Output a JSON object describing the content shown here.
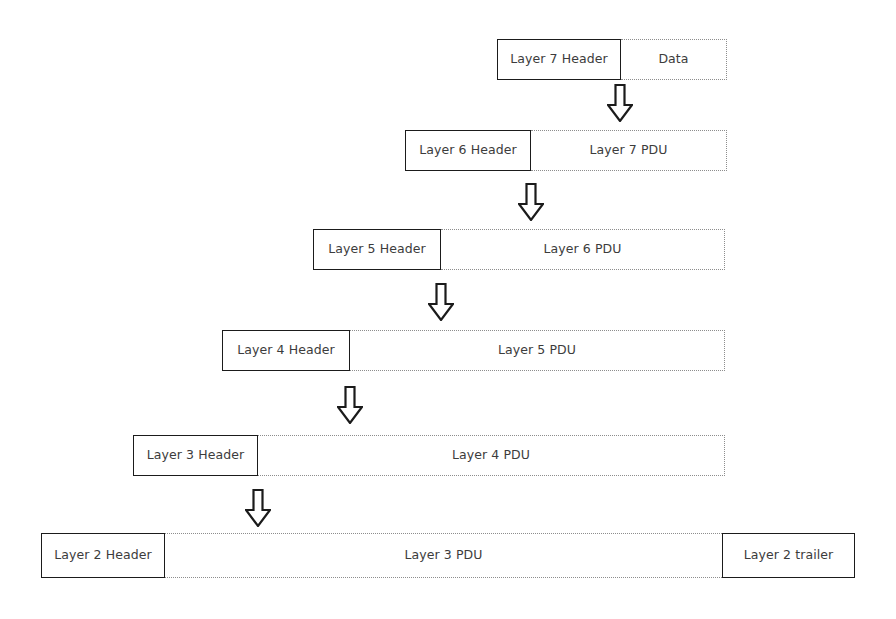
{
  "diagram": {
    "colors": {
      "background": "#ffffff",
      "header_border": "#1b1b1b",
      "payload_border": "#8d8d8d",
      "text": "#3c3c3c",
      "arrow_outline": "#1b1b1b",
      "arrow_fill": "#ffffff"
    },
    "rows": [
      {
        "layer": 7,
        "cells": [
          {
            "label": "Layer 7 Header",
            "kind": "header"
          },
          {
            "label": "Data",
            "kind": "payload"
          }
        ]
      },
      {
        "layer": 6,
        "cells": [
          {
            "label": "Layer 6 Header",
            "kind": "header"
          },
          {
            "label": "Layer 7 PDU",
            "kind": "payload"
          }
        ]
      },
      {
        "layer": 5,
        "cells": [
          {
            "label": "Layer 5 Header",
            "kind": "header"
          },
          {
            "label": "Layer 6 PDU",
            "kind": "payload"
          }
        ]
      },
      {
        "layer": 4,
        "cells": [
          {
            "label": "Layer 4 Header",
            "kind": "header"
          },
          {
            "label": "Layer 5 PDU",
            "kind": "payload"
          }
        ]
      },
      {
        "layer": 3,
        "cells": [
          {
            "label": "Layer 3 Header",
            "kind": "header"
          },
          {
            "label": "Layer 4 PDU",
            "kind": "payload"
          }
        ]
      },
      {
        "layer": 2,
        "cells": [
          {
            "label": "Layer 2 Header",
            "kind": "header"
          },
          {
            "label": "Layer 3 PDU",
            "kind": "payload"
          },
          {
            "label": "Layer 2 trailer",
            "kind": "trailer"
          }
        ]
      }
    ],
    "arrows": [
      {
        "name": "arrow-7-to-6",
        "direction": "down"
      },
      {
        "name": "arrow-6-to-5",
        "direction": "down"
      },
      {
        "name": "arrow-5-to-4",
        "direction": "down"
      },
      {
        "name": "arrow-4-to-3",
        "direction": "down"
      },
      {
        "name": "arrow-3-to-2",
        "direction": "down"
      }
    ]
  }
}
